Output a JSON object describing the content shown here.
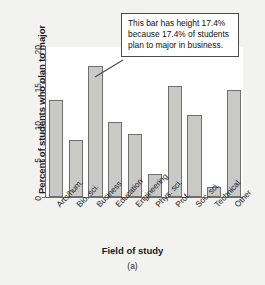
{
  "chart_data": {
    "type": "bar",
    "title": "",
    "xlabel": "Field of study",
    "ylabel": "Percent of students who plan to major",
    "categories": [
      "Arts/hum.",
      "Bio. sci.",
      "Business",
      "Education",
      "Engineering",
      "Phys. sci.",
      "Prof.",
      "Soc. sci.",
      "Technical",
      "Other"
    ],
    "values": [
      12.8,
      7.6,
      17.4,
      10.0,
      8.4,
      3.1,
      14.7,
      10.8,
      1.3,
      14.2
    ],
    "ylim": [
      0,
      20
    ],
    "yticks": [
      "0",
      "5",
      "10",
      "15",
      "20"
    ],
    "ytick_values": [
      0,
      5,
      10,
      15,
      20
    ],
    "grid": false,
    "legend": null,
    "annotations": [
      {
        "text": "This bar has height 17.4% because 17.4% of students plan to major in business.",
        "points_to_category": "Business",
        "points_to_value": 17.4
      }
    ],
    "caption": "(a)"
  },
  "figure": {
    "caption": "(a)",
    "axis_titles": {
      "x": "Field of study",
      "y": "Percent of students who plan to major"
    }
  },
  "callout": {
    "text": "This bar has height 17.4% because 17.4% of students plan to major in business."
  },
  "colors": {
    "bar_fill": "#c9c9c7",
    "bar_stroke": "#6f6f6f",
    "axis": "#6d6d6d",
    "background": "#f2f2f0",
    "plot_background": "#ffffff",
    "text": "#1a1a1a",
    "callout_border": "#4a4a4a"
  }
}
